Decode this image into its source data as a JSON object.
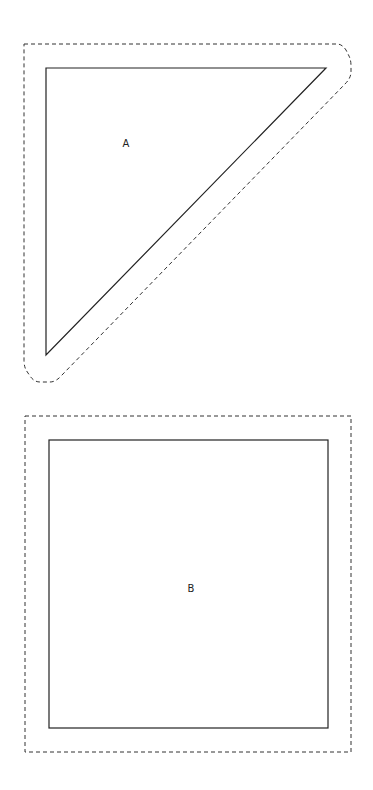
{
  "diagram": {
    "shapes": [
      {
        "id": "A",
        "label": "A",
        "type": "right-triangle",
        "stroke": "#222222",
        "outline_style": "dashed",
        "outline_color": "#333333"
      },
      {
        "id": "B",
        "label": "B",
        "type": "square",
        "stroke": "#222222",
        "outline_style": "dashed",
        "outline_color": "#333333"
      }
    ]
  }
}
